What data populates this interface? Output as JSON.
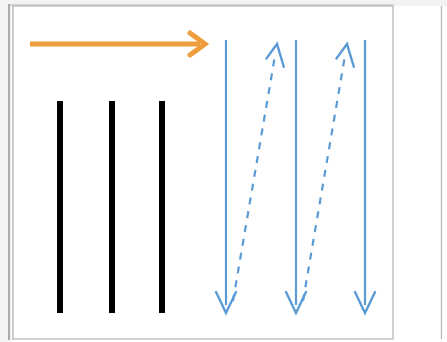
{
  "figure": {
    "background_color": "#ffffff",
    "width": 447,
    "height": 342
  },
  "colors": {
    "orange_arrow": "#ED9D3C",
    "blue_line": "#5B9BD5",
    "black_bar": "#000000",
    "panel_border": "#B8B8B8",
    "edge_shadow": "#9A9A9A"
  },
  "panels": [
    {
      "name": "main-panel",
      "x": 13,
      "y": 6,
      "width": 380,
      "height": 333,
      "border_color": "#B8B8B8"
    },
    {
      "name": "next-panel-edge",
      "x": 441,
      "y": 6,
      "width": 6,
      "height": 333,
      "border_color": "#B8B8B8"
    }
  ],
  "direction_arrow": {
    "name": "horizontal-direction-arrow",
    "label": "scan direction",
    "color": "#ED9D3C",
    "stroke_width": 5,
    "x1": 30,
    "y1": 44,
    "x2": 205,
    "y2": 44,
    "arrowhead": "open-chevron-right"
  },
  "black_bars": {
    "name": "solid-black-bars",
    "color": "#000000",
    "count": 3,
    "width": 6,
    "top": 101,
    "bottom": 313,
    "x_positions": [
      60,
      112,
      162
    ]
  },
  "blue_solid_arrows": {
    "name": "downward-solid-arrows",
    "color": "#5B9BD5",
    "stroke_width": 2.2,
    "count": 3,
    "direction": "down",
    "y_start": 40,
    "y_end": 313,
    "x_positions": [
      226,
      296,
      365
    ],
    "arrowhead": "open-chevron-down"
  },
  "blue_dashed_arrows": {
    "name": "upward-dashed-retrace-arrows",
    "color": "#5B9BD5",
    "stroke_width": 2.2,
    "dash_pattern": "7 7",
    "count": 2,
    "direction": "up-right",
    "segments": [
      {
        "x1": 233,
        "y1": 301,
        "x2": 277,
        "y2": 44
      },
      {
        "x1": 303,
        "y1": 301,
        "x2": 347,
        "y2": 44
      }
    ],
    "arrowhead": "open-chevron-up"
  }
}
